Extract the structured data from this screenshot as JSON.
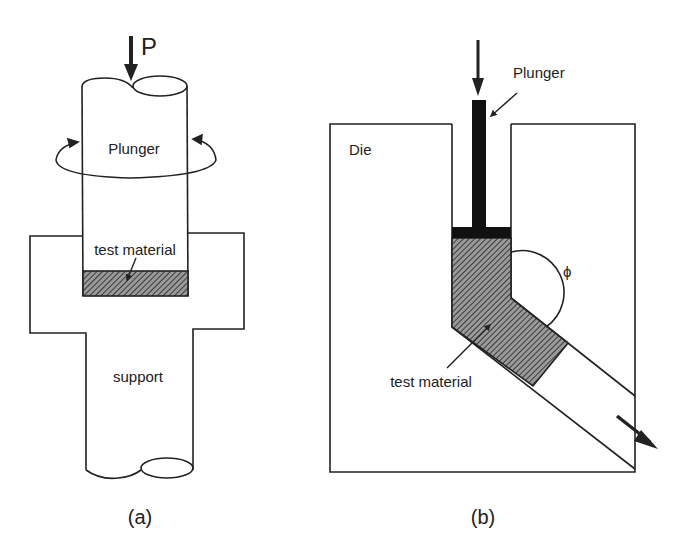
{
  "figure": {
    "panel_a": {
      "caption": "(a)",
      "load_label": "P",
      "plunger_label": "Plunger",
      "material_label": "test material",
      "support_label": "support"
    },
    "panel_b": {
      "caption": "(b)",
      "die_label": "Die",
      "plunger_label": "Plunger",
      "material_label": "test material",
      "angle_label": "ϕ"
    },
    "colors": {
      "line": "#222222",
      "material_fill": "#6e6e6e",
      "plunger_fill": "#111111",
      "background": "#ffffff"
    }
  }
}
